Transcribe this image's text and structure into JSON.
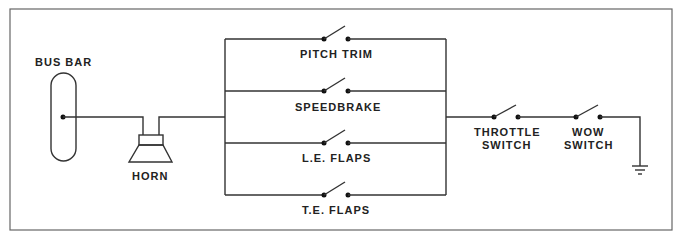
{
  "diagram": {
    "type": "electrical-schematic",
    "labels": {
      "bus_bar": "BUS BAR",
      "horn": "HORN",
      "branches": [
        "PITCH TRIM",
        "SPEEDBRAKE",
        "L.E. FLAPS",
        "T.E. FLAPS"
      ],
      "throttle_switch_1": "THROTTLE",
      "throttle_switch_2": "SWITCH",
      "wow_switch_1": "WOW",
      "wow_switch_2": "SWITCH"
    },
    "components": [
      {
        "id": "bus-bar",
        "kind": "bus-bar"
      },
      {
        "id": "horn",
        "kind": "speaker"
      },
      {
        "id": "pitch-trim-switch",
        "kind": "switch-open"
      },
      {
        "id": "speedbrake-switch",
        "kind": "switch-open"
      },
      {
        "id": "le-flaps-switch",
        "kind": "switch-open"
      },
      {
        "id": "te-flaps-switch",
        "kind": "switch-open"
      },
      {
        "id": "throttle-switch",
        "kind": "switch-open"
      },
      {
        "id": "wow-switch",
        "kind": "switch-open"
      },
      {
        "id": "ground",
        "kind": "ground"
      }
    ],
    "connections": [
      [
        "bus-bar",
        "horn"
      ],
      [
        "horn",
        "parallel-switch-bank"
      ],
      [
        "parallel-switch-bank",
        "throttle-switch"
      ],
      [
        "throttle-switch",
        "wow-switch"
      ],
      [
        "wow-switch",
        "ground"
      ]
    ]
  }
}
